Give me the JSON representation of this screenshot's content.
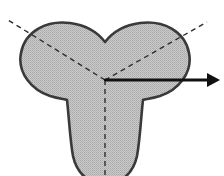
{
  "figure": {
    "title": "Trefoil three-lobed cross-section with symmetry axes",
    "background_color": "#ffffff",
    "width": 224,
    "height": 176,
    "shape": {
      "name": "trefoil-lobed-section",
      "fill_color": "#c2c2c2",
      "fill_pattern": "halftone-dither",
      "outline_color": "#3a3a3a",
      "outline_width": 2.6,
      "lobe_count": 3,
      "center": {
        "x": 105,
        "y": 80
      },
      "path": "M 105,42 C 112,33 124,25 140,23 C 163,20 185,31 189,53 C 193,73 178,90 160,96 C 150,99 145,99 143,100 C 141,117 140,140 137,156 C 134,170 126,178 117,182 L 93,182 C 84,178 76,170 73,156 C 70,140 69,117 67,100 C 65,99 60,99 50,96 C 32,90 17,73 21,53 C 25,31 47,20 70,23 C 86,25 98,33 105,42 Z",
      "cusps": [
        {
          "name": "top-cusp",
          "x": 105,
          "y": 42
        },
        {
          "name": "lower-left-cusp",
          "x": 67,
          "y": 100
        },
        {
          "name": "lower-right-cusp",
          "x": 143,
          "y": 100
        }
      ],
      "extents": {
        "left": 21,
        "right": 189,
        "top": 22,
        "bottom_clipped": 176
      }
    },
    "axes": {
      "color": "#2e2e2e",
      "width": 1.4,
      "dash": "5,4",
      "lines": [
        {
          "name": "axis-upper-left",
          "from": {
            "x": 105,
            "y": 80
          },
          "to": {
            "x": 8,
            "y": 20
          },
          "style": "dashed"
        },
        {
          "name": "axis-upper-right",
          "from": {
            "x": 105,
            "y": 80
          },
          "to": {
            "x": 207,
            "y": 22
          },
          "style": "dashed"
        },
        {
          "name": "axis-vertical-down",
          "from": {
            "x": 105,
            "y": 80
          },
          "to": {
            "x": 105,
            "y": 176
          },
          "style": "dashed"
        }
      ]
    },
    "arrow": {
      "name": "direction-arrow-right",
      "color": "#111111",
      "width": 3,
      "from": {
        "x": 105,
        "y": 80
      },
      "to": {
        "x": 208,
        "y": 80
      },
      "tip": {
        "x": 220,
        "y": 80
      },
      "head_length": 13,
      "head_half_width": 7,
      "style": "solid"
    }
  }
}
